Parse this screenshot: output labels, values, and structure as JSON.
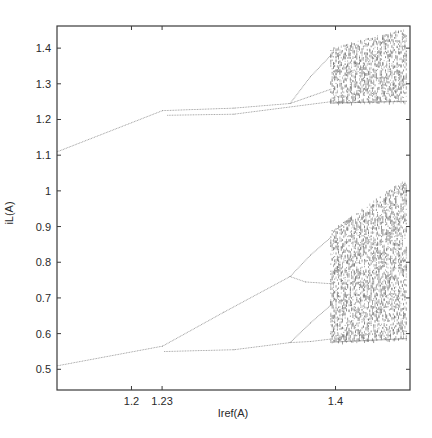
{
  "chart_data": {
    "type": "scatter",
    "title": "",
    "subtitle": "",
    "xlabel": "Iref(A)",
    "ylabel": "iL(A)",
    "xlim": [
      1.127,
      1.473
    ],
    "ylim": [
      0.442,
      1.462
    ],
    "grid": false,
    "legend": null,
    "x_ticks": [
      {
        "value": 1.2,
        "label": "1.2"
      },
      {
        "value": 1.23,
        "label": "1.23"
      },
      {
        "value": 1.4,
        "label": "1.4"
      }
    ],
    "y_ticks": [
      {
        "value": 0.5,
        "label": "0.5"
      },
      {
        "value": 0.6,
        "label": "0.6"
      },
      {
        "value": 0.7,
        "label": "0.7"
      },
      {
        "value": 0.8,
        "label": "0.8"
      },
      {
        "value": 0.9,
        "label": "0.9"
      },
      {
        "value": 1.0,
        "label": "1"
      },
      {
        "value": 1.1,
        "label": "1.1"
      },
      {
        "value": 1.2,
        "label": "1.2"
      },
      {
        "value": 1.3,
        "label": "1.3"
      },
      {
        "value": 1.4,
        "label": "1.4"
      }
    ],
    "series": [
      {
        "name": "upper-period1",
        "points": [
          [
            1.127,
            1.11
          ],
          [
            1.23,
            1.225
          ]
        ]
      },
      {
        "name": "upper-period2-high",
        "points": [
          [
            1.23,
            1.225
          ],
          [
            1.3,
            1.232
          ],
          [
            1.355,
            1.245
          ]
        ]
      },
      {
        "name": "upper-period4-a",
        "points": [
          [
            1.355,
            1.245
          ],
          [
            1.375,
            1.32
          ],
          [
            1.395,
            1.38
          ]
        ]
      },
      {
        "name": "upper-period4-b",
        "points": [
          [
            1.355,
            1.245
          ],
          [
            1.375,
            1.265
          ],
          [
            1.395,
            1.285
          ]
        ]
      },
      {
        "name": "upper-period2-low",
        "points": [
          [
            1.235,
            1.212
          ],
          [
            1.3,
            1.215
          ],
          [
            1.395,
            1.25
          ]
        ]
      },
      {
        "name": "lower-period1",
        "points": [
          [
            1.127,
            0.51
          ],
          [
            1.23,
            0.565
          ]
        ]
      },
      {
        "name": "lower-period2-high",
        "points": [
          [
            1.23,
            0.565
          ],
          [
            1.29,
            0.66
          ],
          [
            1.355,
            0.76
          ]
        ]
      },
      {
        "name": "lower-period4-a",
        "points": [
          [
            1.355,
            0.76
          ],
          [
            1.375,
            0.82
          ],
          [
            1.395,
            0.87
          ]
        ]
      },
      {
        "name": "lower-period4-b",
        "points": [
          [
            1.355,
            0.76
          ],
          [
            1.37,
            0.745
          ],
          [
            1.395,
            0.74
          ]
        ]
      },
      {
        "name": "lower-period2-low",
        "points": [
          [
            1.232,
            0.55
          ],
          [
            1.3,
            0.555
          ],
          [
            1.355,
            0.575
          ]
        ]
      },
      {
        "name": "lower-period4-c",
        "points": [
          [
            1.355,
            0.575
          ],
          [
            1.375,
            0.63
          ],
          [
            1.395,
            0.68
          ]
        ]
      },
      {
        "name": "lower-period4-d",
        "points": [
          [
            1.355,
            0.575
          ],
          [
            1.375,
            0.578
          ],
          [
            1.395,
            0.585
          ]
        ]
      }
    ],
    "chaos_regions": [
      {
        "name": "upper-chaos",
        "x": [
          1.395,
          1.47
        ],
        "y_bottom": [
          1.245,
          1.25
        ],
        "y_top": [
          1.4,
          1.46
        ]
      },
      {
        "name": "lower-chaos",
        "x": [
          1.395,
          1.47
        ],
        "y_bottom": [
          0.575,
          0.585
        ],
        "y_top": [
          0.89,
          1.04
        ]
      }
    ]
  }
}
